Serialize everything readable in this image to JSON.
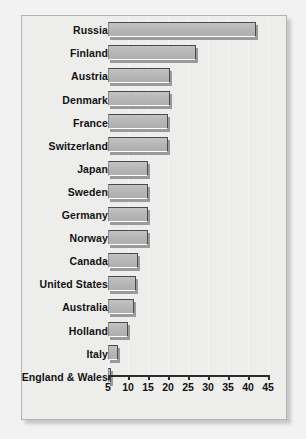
{
  "chart_data": {
    "type": "bar",
    "orientation": "horizontal",
    "title": "",
    "subtitle": "",
    "xlabel": "",
    "ylabel": "",
    "categories": [
      "Russia",
      "Finland",
      "Austria",
      "Denmark",
      "France",
      "Switzerland",
      "Japan",
      "Sweden",
      "Germany",
      "Norway",
      "Canada",
      "United States",
      "Australia",
      "Holland",
      "Italy",
      "England & Wales"
    ],
    "values": [
      42,
      27,
      20.5,
      20.5,
      20,
      20,
      15,
      15,
      15,
      15,
      12.5,
      12,
      11.5,
      10,
      7.5,
      5.8
    ],
    "xlim": [
      5,
      45
    ],
    "xticks": [
      5,
      10,
      15,
      20,
      25,
      30,
      35,
      40,
      45
    ],
    "xtick_labels": [
      "5",
      "10",
      "15",
      "20",
      "25",
      "30",
      "35",
      "40",
      "45"
    ],
    "grid": true,
    "grid_axis": "x",
    "legend": false,
    "legend_position": "none",
    "bar_fill_color": "#b4b4b4",
    "bar_edge_color": "#4a4a4a",
    "bar_shadow_color": "#9a9a9a",
    "plot_background_color": "#ededec",
    "page_background_color": "#f2f2f2",
    "text_color": "#121212"
  }
}
